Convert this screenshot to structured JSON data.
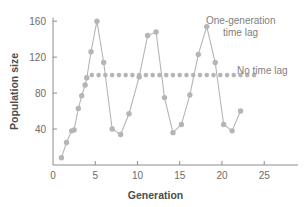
{
  "chart_data": {
    "type": "line",
    "title": "",
    "xlabel": "Generation",
    "ylabel": "Population size",
    "xlim": [
      0,
      29
    ],
    "ylim": [
      0,
      168
    ],
    "xticks": [
      0,
      5,
      10,
      15,
      20,
      25
    ],
    "xtick_labels": [
      "0",
      "5",
      "10",
      "15",
      "20",
      "25"
    ],
    "yticks": [
      0,
      40,
      80,
      120,
      160
    ],
    "ytick_labels": [
      "0",
      "40",
      "80",
      "120",
      "160"
    ],
    "grid": false,
    "legend_position": "inside-right",
    "series": [
      {
        "name": "One-generation time lag",
        "color": "#b5b5b5",
        "marker": "circle",
        "line_style": "solid",
        "points": [
          {
            "x": 1.0,
            "y": 8
          },
          {
            "x": 1.6,
            "y": 25
          },
          {
            "x": 2.2,
            "y": 38
          },
          {
            "x": 2.5,
            "y": 39
          },
          {
            "x": 3.0,
            "y": 63
          },
          {
            "x": 3.4,
            "y": 77
          },
          {
            "x": 3.8,
            "y": 89
          },
          {
            "x": 4.0,
            "y": 97
          },
          {
            "x": 4.5,
            "y": 126
          },
          {
            "x": 5.2,
            "y": 160
          },
          {
            "x": 6.0,
            "y": 114
          },
          {
            "x": 7.0,
            "y": 40
          },
          {
            "x": 8.0,
            "y": 34
          },
          {
            "x": 9.0,
            "y": 57
          },
          {
            "x": 10.2,
            "y": 98
          },
          {
            "x": 11.2,
            "y": 144
          },
          {
            "x": 12.2,
            "y": 148
          },
          {
            "x": 13.2,
            "y": 75
          },
          {
            "x": 14.2,
            "y": 36
          },
          {
            "x": 15.2,
            "y": 45
          },
          {
            "x": 16.2,
            "y": 78
          },
          {
            "x": 17.2,
            "y": 123
          },
          {
            "x": 18.2,
            "y": 154
          },
          {
            "x": 19.2,
            "y": 114
          },
          {
            "x": 20.2,
            "y": 45
          },
          {
            "x": 21.2,
            "y": 38
          },
          {
            "x": 22.2,
            "y": 60
          }
        ]
      },
      {
        "name": "No time lag",
        "color": "#b5b5b5",
        "marker": "circle",
        "line_style": "dotted",
        "points": [
          {
            "x": 4.6,
            "y": 100
          },
          {
            "x": 5.4,
            "y": 100
          },
          {
            "x": 6.2,
            "y": 100
          },
          {
            "x": 7.0,
            "y": 100
          },
          {
            "x": 7.8,
            "y": 100
          },
          {
            "x": 8.6,
            "y": 100
          },
          {
            "x": 9.4,
            "y": 100
          },
          {
            "x": 10.2,
            "y": 100
          },
          {
            "x": 11.0,
            "y": 100
          },
          {
            "x": 11.8,
            "y": 100
          },
          {
            "x": 12.6,
            "y": 100
          },
          {
            "x": 13.4,
            "y": 100
          },
          {
            "x": 14.2,
            "y": 100
          },
          {
            "x": 15.0,
            "y": 100
          },
          {
            "x": 15.8,
            "y": 100
          },
          {
            "x": 16.6,
            "y": 100
          },
          {
            "x": 17.4,
            "y": 100
          },
          {
            "x": 18.2,
            "y": 100
          },
          {
            "x": 19.0,
            "y": 100
          },
          {
            "x": 19.8,
            "y": 100
          },
          {
            "x": 20.6,
            "y": 100
          },
          {
            "x": 21.4,
            "y": 100
          },
          {
            "x": 22.2,
            "y": 100
          },
          {
            "x": 23.0,
            "y": 100
          },
          {
            "x": 23.8,
            "y": 100
          }
        ]
      }
    ],
    "annotations": [
      {
        "name": "one-generation-time-lag-label",
        "text_line1": "One-generation",
        "text_line2": "time lag"
      },
      {
        "name": "no-time-lag-label",
        "text_line1": "No time lag",
        "text_line2": ""
      }
    ],
    "colors": {
      "data": "#b5b5b5",
      "axis": "#8c8c8c",
      "tick_text": "#6b6b6b",
      "axis_title": "#4d4d4d",
      "legend_text": "#808080",
      "background": "#ffffff"
    }
  }
}
